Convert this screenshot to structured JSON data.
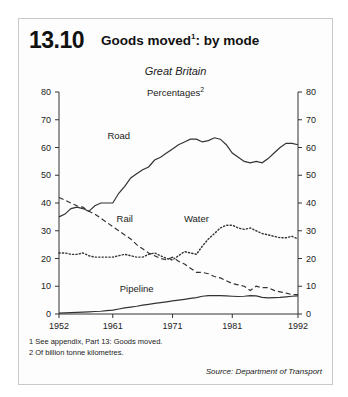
{
  "figure": {
    "number": "13.10",
    "title": "Goods moved",
    "title_superscript": "1",
    "subtitle": "Great Britain",
    "units": "Percentages",
    "units_superscript": "2",
    "source": "Source: Department of Transport",
    "footnotes": [
      "1  See appendix, Part 13: Goods moved.",
      "2  Of billion tonne kilometres."
    ]
  },
  "chart_data": {
    "type": "line",
    "subtitle": "Great Britain",
    "xlabel": "",
    "ylabel": "Percentages",
    "xlim": [
      1952,
      1992
    ],
    "ylim": [
      0,
      80
    ],
    "ytick_values": [
      0,
      10,
      20,
      30,
      40,
      50,
      60,
      70,
      80
    ],
    "ytick_labels": [
      "0",
      "10",
      "20",
      "30",
      "40",
      "50",
      "60",
      "70",
      "80"
    ],
    "xtick_values": [
      1952,
      1961,
      1971,
      1981,
      1992
    ],
    "xtick_labels": [
      "1952",
      "1961",
      "1971",
      "1981",
      "1992"
    ],
    "grid": false,
    "legend": "inline-labels",
    "dual_y_axis": true,
    "x": [
      1952,
      1953,
      1954,
      1955,
      1956,
      1957,
      1958,
      1959,
      1960,
      1961,
      1962,
      1963,
      1964,
      1965,
      1966,
      1967,
      1968,
      1969,
      1970,
      1971,
      1972,
      1973,
      1974,
      1975,
      1976,
      1977,
      1978,
      1979,
      1980,
      1981,
      1982,
      1983,
      1984,
      1985,
      1986,
      1987,
      1988,
      1989,
      1990,
      1991,
      1992
    ],
    "series": [
      {
        "name": "Road",
        "style": "solid",
        "values": [
          35,
          36,
          38,
          38.5,
          38,
          37,
          39,
          40,
          40,
          40,
          43.5,
          46,
          49,
          50.5,
          52,
          53,
          55.5,
          56.5,
          58,
          59.5,
          61,
          62,
          63,
          63,
          62,
          62.5,
          63.5,
          63,
          61,
          58,
          56.5,
          55,
          54.5,
          55,
          54.5,
          56,
          58,
          60,
          61.5,
          61.5,
          61
        ]
      },
      {
        "name": "Rail",
        "style": "dashed",
        "values": [
          42,
          41,
          40,
          39,
          38.5,
          37,
          36,
          34.5,
          33,
          31.5,
          30,
          28.5,
          27,
          25,
          23.5,
          22,
          21,
          20,
          19.5,
          20.5,
          19,
          18,
          16.5,
          15,
          15,
          14.5,
          13.5,
          13,
          12,
          11,
          10.5,
          10,
          8.5,
          10,
          9.5,
          9.5,
          8.5,
          8,
          7.5,
          7,
          7
        ]
      },
      {
        "name": "Water",
        "style": "dotted",
        "values": [
          22,
          22,
          21.5,
          21.5,
          22,
          21,
          20.5,
          20.5,
          20.5,
          20.5,
          21,
          21.5,
          21,
          20.5,
          20.5,
          21.5,
          22,
          21,
          20,
          19.5,
          21,
          22.5,
          22,
          21.5,
          24.5,
          27,
          29,
          31,
          32,
          32,
          31,
          30.5,
          31,
          30,
          29,
          28.5,
          28,
          27.5,
          27.5,
          28,
          27
        ]
      },
      {
        "name": "Pipeline",
        "style": "solid",
        "values": [
          0.3,
          0.4,
          0.5,
          0.6,
          0.7,
          0.8,
          0.9,
          1.0,
          1.2,
          1.4,
          1.8,
          2.2,
          2.5,
          2.8,
          3.2,
          3.5,
          3.8,
          4.1,
          4.4,
          4.7,
          5.0,
          5.3,
          5.6,
          5.9,
          6.4,
          6.6,
          6.6,
          6.6,
          6.5,
          6.4,
          6.3,
          6.4,
          6.6,
          6.5,
          6.0,
          5.8,
          5.9,
          6.0,
          6.2,
          6.4,
          6.5
        ]
      }
    ],
    "series_label_positions": [
      {
        "name": "Road",
        "x": 1962,
        "y": 63
      },
      {
        "name": "Rail",
        "x": 1963,
        "y": 33
      },
      {
        "name": "Water",
        "x": 1975,
        "y": 33
      },
      {
        "name": "Pipeline",
        "x": 1965,
        "y": 8
      }
    ]
  }
}
